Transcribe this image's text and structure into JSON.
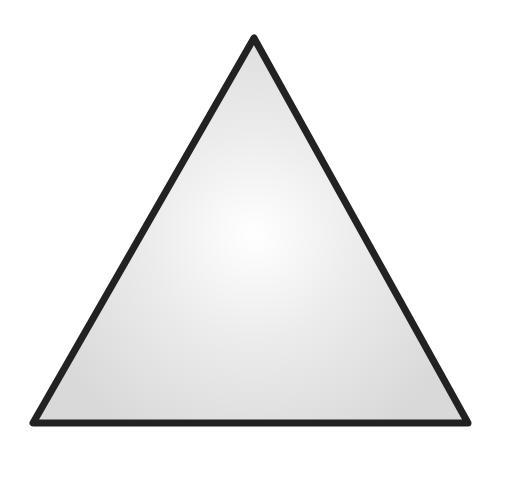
{
  "figure": {
    "shape": "triangle",
    "kind": "equilateral",
    "vertices": {
      "apex": [
        254,
        38
      ],
      "bottom_left": [
        33,
        423
      ],
      "bottom_right": [
        468,
        423
      ]
    },
    "stroke_color": "#222222",
    "stroke_width": 7,
    "fill_center_color": "#ffffff",
    "fill_edge_color": "#d9d9d9",
    "background_color": "#ffffff"
  }
}
